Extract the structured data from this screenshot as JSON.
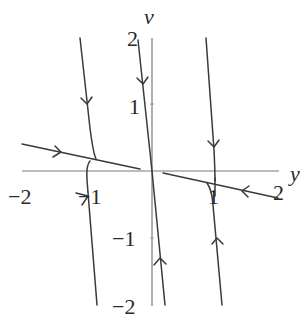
{
  "diagram": {
    "type": "phase-portrait",
    "axes": {
      "horizontal": {
        "name": "y",
        "range": [
          -2,
          2
        ],
        "ticks": [
          {
            "value": -2,
            "label": "−2"
          },
          {
            "value": -1,
            "label": "−1"
          },
          {
            "value": 1,
            "label": "1"
          },
          {
            "value": 2,
            "label": "2"
          }
        ]
      },
      "vertical": {
        "name": "v",
        "range": [
          -2,
          2
        ],
        "ticks": [
          {
            "value": 2,
            "label": "2"
          },
          {
            "value": 1,
            "label": "1"
          },
          {
            "value": -1,
            "label": "−1"
          },
          {
            "value": -2,
            "label": "−2"
          }
        ]
      }
    },
    "line_color": "#3a3a3a",
    "axis_color": "#7a7a7a",
    "trajectories": [
      {
        "id": "slow-manifold-left",
        "direction": "toward-origin"
      },
      {
        "id": "slow-manifold-right",
        "direction": "toward-origin"
      },
      {
        "id": "fast-manifold",
        "direction": "toward-origin"
      },
      {
        "id": "left-upper-curve",
        "direction": "down"
      },
      {
        "id": "left-lower-curve",
        "direction": "up"
      },
      {
        "id": "right-upper-curve",
        "direction": "down"
      },
      {
        "id": "right-lower-curve",
        "direction": "up"
      }
    ]
  }
}
